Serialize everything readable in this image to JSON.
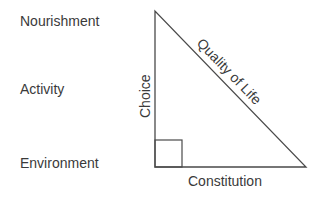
{
  "left_labels": [
    {
      "text": "Nourishment"
    },
    {
      "text": "Activity"
    },
    {
      "text": "Environment"
    }
  ],
  "triangle": {
    "vertical_side_label": "Choice",
    "hypotenuse_label": "Quality of Life",
    "base_label": "Constitution",
    "right_angle_marker": true,
    "stroke_color": "#4a4a4a"
  }
}
